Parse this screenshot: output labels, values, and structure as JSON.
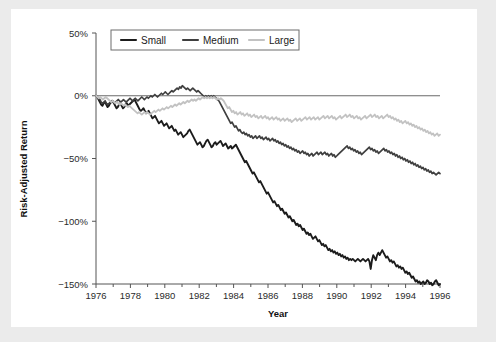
{
  "figure": {
    "background": "#ebebeb",
    "canvas_background": "#ffffff"
  },
  "chart_data": {
    "type": "line",
    "title": "",
    "xlabel": "Year",
    "ylabel": "Risk-Adjusted Return",
    "xlim": [
      1976,
      1996
    ],
    "ylim": [
      -150,
      50
    ],
    "xtick_labels": [
      "1976",
      "1978",
      "1980",
      "1982",
      "1984",
      "1986",
      "1988",
      "1990",
      "1992",
      "1994",
      "1996"
    ],
    "xtick_values": [
      1976,
      1978,
      1980,
      1982,
      1984,
      1986,
      1988,
      1990,
      1992,
      1994,
      1996
    ],
    "xminor_values": [
      1977,
      1979,
      1981,
      1983,
      1985,
      1987,
      1989,
      1991,
      1993,
      1995
    ],
    "ytick_labels": [
      "50%",
      "0%",
      "−50%",
      "−100%",
      "−150%"
    ],
    "ytick_values": [
      50,
      0,
      -50,
      -100,
      -150
    ],
    "grid": false,
    "legend_position": "upper-left-inside",
    "reference_line": {
      "y": 0,
      "color": "#6a6a6a",
      "x_end": 1996
    },
    "x_step": 0.08333,
    "series": [
      {
        "name": "Small",
        "color": "#1c1c1c",
        "width": 1.9,
        "values": [
          0,
          -1,
          -3,
          -5,
          -7,
          -8,
          -6,
          -5,
          -7,
          -9,
          -8,
          -6,
          -5,
          -4,
          -6,
          -8,
          -10,
          -9,
          -7,
          -6,
          -8,
          -10,
          -9,
          -7,
          -6,
          -8,
          -7,
          -6,
          -5,
          -4,
          -3,
          -5,
          -7,
          -9,
          -11,
          -12,
          -11,
          -10,
          -12,
          -14,
          -13,
          -12,
          -14,
          -16,
          -18,
          -17,
          -16,
          -18,
          -20,
          -22,
          -21,
          -20,
          -22,
          -24,
          -23,
          -22,
          -24,
          -26,
          -25,
          -24,
          -26,
          -28,
          -27,
          -29,
          -31,
          -30,
          -29,
          -31,
          -33,
          -32,
          -31,
          -30,
          -28,
          -27,
          -29,
          -31,
          -33,
          -35,
          -37,
          -39,
          -38,
          -37,
          -39,
          -41,
          -40,
          -38,
          -36,
          -35,
          -37,
          -39,
          -41,
          -40,
          -38,
          -37,
          -39,
          -38,
          -37,
          -36,
          -38,
          -40,
          -39,
          -38,
          -40,
          -42,
          -41,
          -40,
          -42,
          -41,
          -40,
          -39,
          -41,
          -43,
          -45,
          -47,
          -49,
          -51,
          -53,
          -52,
          -54,
          -56,
          -58,
          -60,
          -62,
          -61,
          -63,
          -65,
          -67,
          -69,
          -68,
          -70,
          -72,
          -74,
          -76,
          -78,
          -77,
          -79,
          -81,
          -83,
          -85,
          -84,
          -86,
          -88,
          -87,
          -89,
          -91,
          -90,
          -92,
          -94,
          -93,
          -95,
          -97,
          -96,
          -98,
          -100,
          -99,
          -101,
          -103,
          -102,
          -104,
          -103,
          -105,
          -107,
          -106,
          -108,
          -110,
          -109,
          -111,
          -110,
          -112,
          -114,
          -113,
          -112,
          -114,
          -116,
          -115,
          -117,
          -119,
          -118,
          -120,
          -119,
          -121,
          -123,
          -122,
          -124,
          -123,
          -125,
          -124,
          -126,
          -125,
          -127,
          -126,
          -128,
          -127,
          -129,
          -128,
          -130,
          -129,
          -131,
          -130,
          -131,
          -130,
          -131,
          -132,
          -131,
          -130,
          -131,
          -132,
          -131,
          -130,
          -131,
          -132,
          -131,
          -130,
          -132,
          -138,
          -131,
          -127,
          -129,
          -131,
          -127,
          -125,
          -127,
          -125,
          -123,
          -125,
          -127,
          -129,
          -128,
          -130,
          -132,
          -131,
          -133,
          -132,
          -134,
          -136,
          -135,
          -137,
          -136,
          -138,
          -137,
          -139,
          -141,
          -140,
          -142,
          -141,
          -143,
          -145,
          -144,
          -146,
          -148,
          -147,
          -149,
          -148,
          -150,
          -149,
          -148,
          -150,
          -149,
          -147,
          -148,
          -150,
          -149,
          -151,
          -150,
          -148,
          -147,
          -149,
          -151,
          -150
        ]
      },
      {
        "name": "Medium",
        "color": "#3f3f3f",
        "width": 1.7,
        "values": [
          0,
          -1,
          -2,
          -3,
          -5,
          -6,
          -5,
          -4,
          -6,
          -7,
          -6,
          -5,
          -4,
          -5,
          -6,
          -5,
          -4,
          -3,
          -4,
          -5,
          -4,
          -3,
          -4,
          -5,
          -4,
          -3,
          -2,
          -3,
          -4,
          -3,
          -2,
          -3,
          -4,
          -3,
          -2,
          -1,
          -2,
          -3,
          -2,
          -1,
          -2,
          -1,
          0,
          -1,
          0,
          1,
          0,
          -1,
          0,
          1,
          2,
          1,
          2,
          3,
          2,
          1,
          2,
          3,
          4,
          3,
          4,
          5,
          6,
          5,
          7,
          6,
          8,
          7,
          6,
          5,
          6,
          5,
          4,
          5,
          6,
          5,
          4,
          3,
          4,
          3,
          2,
          1,
          0,
          -1,
          0,
          -1,
          0,
          -1,
          0,
          -1,
          0,
          -1,
          -2,
          -3,
          -4,
          -6,
          -8,
          -10,
          -12,
          -14,
          -16,
          -18,
          -20,
          -22,
          -21,
          -23,
          -25,
          -24,
          -26,
          -28,
          -27,
          -29,
          -30,
          -29,
          -31,
          -30,
          -32,
          -31,
          -33,
          -32,
          -34,
          -33,
          -32,
          -34,
          -33,
          -32,
          -34,
          -33,
          -35,
          -34,
          -33,
          -35,
          -34,
          -36,
          -35,
          -34,
          -36,
          -35,
          -37,
          -36,
          -38,
          -37,
          -39,
          -38,
          -40,
          -39,
          -41,
          -40,
          -42,
          -41,
          -43,
          -42,
          -44,
          -43,
          -45,
          -44,
          -46,
          -45,
          -44,
          -46,
          -45,
          -47,
          -46,
          -48,
          -47,
          -46,
          -48,
          -47,
          -46,
          -45,
          -47,
          -46,
          -45,
          -47,
          -46,
          -45,
          -47,
          -46,
          -48,
          -47,
          -46,
          -48,
          -47,
          -49,
          -48,
          -47,
          -46,
          -45,
          -44,
          -43,
          -42,
          -41,
          -40,
          -42,
          -41,
          -43,
          -42,
          -44,
          -43,
          -45,
          -44,
          -46,
          -45,
          -47,
          -46,
          -45,
          -44,
          -43,
          -42,
          -41,
          -43,
          -42,
          -44,
          -43,
          -45,
          -44,
          -46,
          -45,
          -44,
          -43,
          -42,
          -44,
          -43,
          -45,
          -44,
          -46,
          -45,
          -47,
          -46,
          -48,
          -47,
          -49,
          -48,
          -50,
          -49,
          -51,
          -50,
          -52,
          -51,
          -53,
          -52,
          -54,
          -53,
          -55,
          -54,
          -56,
          -55,
          -57,
          -56,
          -58,
          -57,
          -59,
          -58,
          -60,
          -59,
          -61,
          -60,
          -62,
          -61,
          -62,
          -63,
          -62,
          -61,
          -62
        ]
      },
      {
        "name": "Large",
        "color": "#c2c2c2",
        "width": 1.8,
        "values": [
          0,
          -1,
          -2,
          -1,
          -2,
          -3,
          -2,
          -1,
          -2,
          -3,
          -4,
          -5,
          -4,
          -5,
          -6,
          -5,
          -6,
          -7,
          -6,
          -7,
          -8,
          -7,
          -8,
          -9,
          -8,
          -9,
          -10,
          -11,
          -12,
          -13,
          -14,
          -13,
          -14,
          -15,
          -14,
          -13,
          -14,
          -13,
          -14,
          -15,
          -14,
          -13,
          -12,
          -13,
          -12,
          -11,
          -12,
          -11,
          -10,
          -11,
          -10,
          -9,
          -10,
          -9,
          -8,
          -9,
          -8,
          -7,
          -8,
          -7,
          -6,
          -7,
          -6,
          -5,
          -6,
          -5,
          -4,
          -5,
          -4,
          -3,
          -4,
          -3,
          -4,
          -3,
          -2,
          -3,
          -2,
          -1,
          -2,
          -1,
          -2,
          -1,
          -2,
          -1,
          -2,
          -1,
          -2,
          -3,
          -2,
          -3,
          -2,
          -3,
          -4,
          -6,
          -8,
          -10,
          -9,
          -11,
          -13,
          -12,
          -14,
          -13,
          -15,
          -14,
          -13,
          -15,
          -14,
          -16,
          -15,
          -14,
          -16,
          -15,
          -17,
          -16,
          -15,
          -17,
          -16,
          -18,
          -17,
          -16,
          -18,
          -17,
          -16,
          -18,
          -17,
          -19,
          -18,
          -17,
          -19,
          -18,
          -17,
          -19,
          -18,
          -20,
          -19,
          -18,
          -20,
          -19,
          -18,
          -20,
          -19,
          -21,
          -20,
          -19,
          -18,
          -20,
          -19,
          -18,
          -20,
          -19,
          -18,
          -17,
          -19,
          -18,
          -17,
          -19,
          -18,
          -17,
          -19,
          -18,
          -17,
          -19,
          -18,
          -17,
          -16,
          -18,
          -17,
          -16,
          -18,
          -17,
          -16,
          -18,
          -17,
          -19,
          -18,
          -17,
          -16,
          -18,
          -17,
          -16,
          -15,
          -17,
          -16,
          -15,
          -17,
          -16,
          -18,
          -17,
          -16,
          -18,
          -17,
          -19,
          -18,
          -17,
          -16,
          -18,
          -17,
          -16,
          -15,
          -17,
          -16,
          -15,
          -17,
          -16,
          -18,
          -17,
          -16,
          -18,
          -17,
          -16,
          -15,
          -17,
          -16,
          -18,
          -17,
          -19,
          -18,
          -20,
          -19,
          -21,
          -20,
          -22,
          -21,
          -20,
          -22,
          -21,
          -23,
          -22,
          -24,
          -23,
          -25,
          -24,
          -26,
          -25,
          -27,
          -26,
          -28,
          -27,
          -29,
          -28,
          -30,
          -29,
          -31,
          -30,
          -32,
          -31,
          -30,
          -32,
          -31
        ]
      }
    ]
  },
  "legend": {
    "items": [
      {
        "label": "Small",
        "color": "#1c1c1c"
      },
      {
        "label": "Medium",
        "color": "#3f3f3f"
      },
      {
        "label": "Large",
        "color": "#c2c2c2"
      }
    ]
  }
}
